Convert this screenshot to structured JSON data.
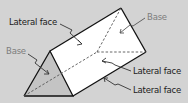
{
  "diagram": {
    "colors": {
      "background": "#d3d3d3",
      "face": "#ffffff",
      "base": "#c4c4c4",
      "edge": "#111111",
      "base_label": "#7d7d7d",
      "lateral_label": "#1a1a1a"
    },
    "labels": {
      "lateral_top": "Lateral face",
      "base_left": "Base",
      "base_right": "Base",
      "lateral_mid": "Lateral face",
      "lateral_bottom": "Lateral face"
    }
  }
}
